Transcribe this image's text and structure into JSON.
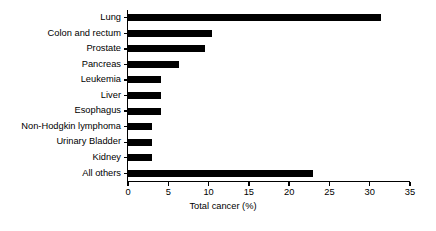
{
  "chart_data": {
    "type": "bar",
    "orientation": "horizontal",
    "title": "",
    "xlabel": "Total cancer (%)",
    "ylabel": "",
    "xlim": [
      0,
      35
    ],
    "xticks": [
      0,
      5,
      10,
      15,
      20,
      25,
      30,
      35
    ],
    "grid": false,
    "legend": null,
    "bar_color": "#000000",
    "background_color": "#ffffff",
    "categories": [
      "Lung",
      "Colon and rectum",
      "Prostate",
      "Pancreas",
      "Leukemia",
      "Liver",
      "Esophagus",
      "Non-Hodgkin lymphoma",
      "Urinary Bladder",
      "Kidney",
      "All others"
    ],
    "values": [
      31.4,
      10.4,
      9.6,
      6.3,
      4.1,
      4.1,
      4.1,
      3.0,
      3.0,
      3.0,
      23.0
    ]
  }
}
